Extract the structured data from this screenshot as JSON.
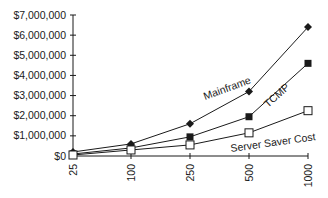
{
  "chart_data": {
    "type": "line",
    "title": "",
    "xlabel": "",
    "ylabel": "",
    "categories": [
      "25",
      "100",
      "250",
      "500",
      "1000"
    ],
    "yticks": [
      "$0",
      "$1,000,000",
      "$2,000,000",
      "$3,000,000",
      "$4,000,000",
      "$5,000,000",
      "$6,000,000",
      "$7,000,000"
    ],
    "ylim": [
      0,
      7000000
    ],
    "grid": false,
    "legend": "inline labels",
    "series": [
      {
        "name": "Mainframe",
        "marker": "diamond-filled",
        "values": [
          200000,
          600000,
          1600000,
          3200000,
          6400000
        ]
      },
      {
        "name": "TCMP",
        "marker": "square-filled",
        "values": [
          100000,
          400000,
          950000,
          1950000,
          4600000
        ]
      },
      {
        "name": "Server Saver Cost",
        "marker": "square-open",
        "values": [
          50000,
          300000,
          550000,
          1150000,
          2250000
        ]
      }
    ]
  },
  "colors": {
    "line": "#1a1a1a",
    "background": "#ffffff"
  }
}
